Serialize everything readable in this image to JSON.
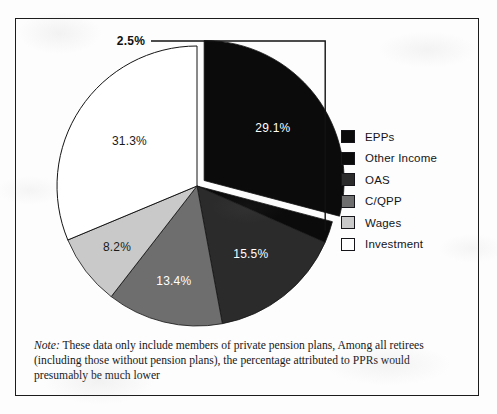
{
  "figure": {
    "background_color": "#fdfdfd",
    "border_color": "#1c1c1c"
  },
  "chart_data": {
    "type": "pie",
    "title": "",
    "categories": [
      "EPPs",
      "Other Income",
      "OAS",
      "C/QPP",
      "Wages",
      "Investment"
    ],
    "values": [
      29.1,
      2.5,
      15.5,
      13.4,
      8.2,
      31.3
    ],
    "value_labels": [
      "29.1%",
      "2.5%",
      "15.5%",
      "13.4%",
      "8.2%",
      "31.3%"
    ],
    "colors": [
      "#0b0b0b",
      "#0b0b0b",
      "#2b2b2b",
      "#6e6e6e",
      "#c9c9c9",
      "#ffffff"
    ],
    "label_text_colors": [
      "#ffffff",
      "#111111",
      "#ffffff",
      "#ffffff",
      "#1a1a1a",
      "#1a1a1a"
    ],
    "exploded": [
      "EPPs"
    ],
    "callout_slices": [
      "Other Income"
    ],
    "legend_position": "right",
    "units": "percent",
    "xlabel": "",
    "ylabel": ""
  },
  "legend": {
    "items": [
      {
        "label": "EPPs",
        "color": "#0b0b0b"
      },
      {
        "label": "Other Income",
        "color": "#0b0b0b"
      },
      {
        "label": "OAS",
        "color": "#2b2b2b"
      },
      {
        "label": "C/QPP",
        "color": "#6e6e6e"
      },
      {
        "label": "Wages",
        "color": "#c9c9c9"
      },
      {
        "label": "Investment",
        "color": "#ffffff"
      }
    ]
  },
  "note": {
    "prefix": "Note:",
    "text": " These data only include members of private pension plans, Among all retirees (including those without pension plans), the percentage attributed to PPRs would presumably be much lower"
  }
}
